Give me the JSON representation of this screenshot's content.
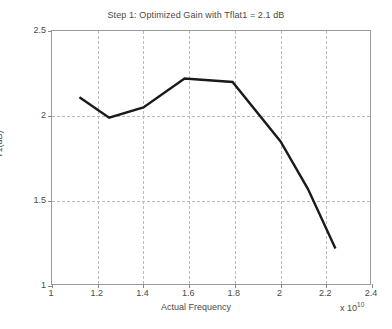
{
  "chart_data": {
    "type": "line",
    "title": "Step 1: Optimized Gain with Tflat1 = 2.1 dB",
    "xlabel": "Actual Frequency",
    "ylabel": "T1(dB)",
    "x_multiplier_text": "x 10",
    "x_multiplier_exp": "10",
    "xlim": [
      1,
      2.4
    ],
    "ylim": [
      1,
      2.5
    ],
    "grid": true,
    "legend": null,
    "xticks": [
      1,
      1.2,
      1.4,
      1.6,
      1.8,
      2,
      2.2,
      2.4
    ],
    "xtick_labels": [
      "1",
      "1.2",
      "1.4",
      "1.6",
      "1.8",
      "2",
      "2.2",
      "2.4"
    ],
    "yticks": [
      1,
      1.5,
      2,
      2.5
    ],
    "ytick_labels": [
      "1",
      "1.5",
      "2",
      "2.5"
    ],
    "series": [
      {
        "name": "T1",
        "color": "#1a1a1a",
        "linewidth": 2.4,
        "x": [
          1.12,
          1.25,
          1.4,
          1.58,
          1.79,
          2.0,
          2.12,
          2.24
        ],
        "y": [
          2.11,
          1.99,
          2.05,
          2.22,
          2.2,
          1.85,
          1.57,
          1.22
        ]
      }
    ]
  }
}
